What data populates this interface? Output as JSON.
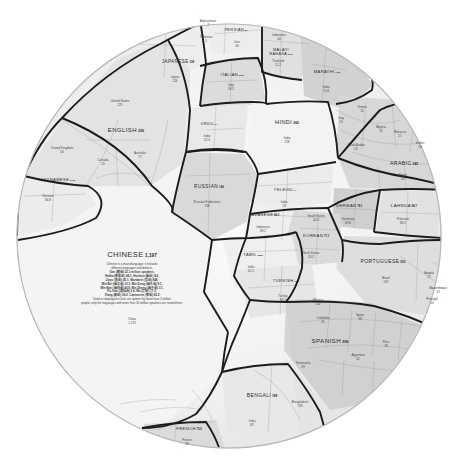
{
  "meta": {
    "subtitle": "Native speakers, in millions",
    "shape": "circular voronoi treemap",
    "unit": "millions of native speakers"
  },
  "chart_data": {
    "type": "treemap",
    "ylabel": "",
    "xlabel": "",
    "value_unit": "millions of native speakers",
    "layout": "circle packed voronoi; each language cell subdivided by country",
    "categories": [
      "CHINESE",
      "SPANISH",
      "ENGLISH",
      "HINDI",
      "ARABIC",
      "PORTUGUESE",
      "BENGALI",
      "RUSSIAN",
      "JAPANESE",
      "LAHNDA",
      "JAVANESE",
      "GERMAN",
      "KOREAN",
      "FRENCH",
      "TELEGU",
      "MARATHI",
      "TURKISH",
      "TAMIL",
      "VIETNAMESE",
      "URDU",
      "ITALIAN",
      "MALAY/BAHASA",
      "PERSIAN"
    ],
    "values": [
      1197,
      399,
      335,
      260,
      242,
      203,
      189,
      166,
      128,
      88.7,
      84.3,
      78.1,
      77.2,
      75.9,
      74,
      71.8,
      70.9,
      68.8,
      67.8,
      64,
      63.8,
      60.5,
      57
    ],
    "series": [
      {
        "name": "native speakers (millions)",
        "values": [
          1197,
          399,
          335,
          260,
          242,
          203,
          189,
          166,
          128,
          88.7,
          84.3,
          78.1,
          77.2,
          75.9,
          74,
          71.8,
          70.9,
          68.8,
          67.8,
          64,
          63.8,
          60.5,
          57
        ]
      }
    ]
  },
  "languages": [
    {
      "name": "CHINESE",
      "value": "1,197",
      "x": 132,
      "y": 255,
      "size": 7.6,
      "countries": [
        {
          "name": "China",
          "value": "1,191",
          "x": 132,
          "y": 322
        }
      ]
    },
    {
      "name": "SPANISH",
      "value": "399",
      "x": 330,
      "y": 341,
      "size": 6.2,
      "countries": [
        {
          "name": "Mexico",
          "value": "102",
          "x": 318,
          "y": 303
        },
        {
          "name": "Colombia",
          "value": "45",
          "x": 323,
          "y": 321
        },
        {
          "name": "Spain",
          "value": "38",
          "x": 360,
          "y": 318
        },
        {
          "name": "Argentina",
          "value": "41",
          "x": 358,
          "y": 358
        },
        {
          "name": "Peru",
          "value": "26",
          "x": 386,
          "y": 345
        },
        {
          "name": "Venezuela",
          "value": "29",
          "x": 303,
          "y": 366
        }
      ]
    },
    {
      "name": "ENGLISH",
      "value": "335",
      "x": 126,
      "y": 130,
      "size": 6.0,
      "countries": [
        {
          "name": "United States",
          "value": "225",
          "x": 120,
          "y": 104
        },
        {
          "name": "United Kingdom",
          "value": "56",
          "x": 62,
          "y": 151
        },
        {
          "name": "Canada",
          "value": "20",
          "x": 103,
          "y": 163
        },
        {
          "name": "Australia",
          "value": "17",
          "x": 140,
          "y": 156
        }
      ]
    },
    {
      "name": "HINDI",
      "value": "260",
      "x": 287,
      "y": 123,
      "size": 5.6,
      "countries": [
        {
          "name": "India",
          "value": "258",
          "x": 287,
          "y": 141
        }
      ]
    },
    {
      "name": "ARABIC",
      "value": "242",
      "x": 404,
      "y": 164,
      "size": 5.2,
      "countries": [
        {
          "name": "Egypt",
          "value": "65",
          "x": 403,
          "y": 178
        },
        {
          "name": "Algeria",
          "value": "32",
          "x": 381,
          "y": 130
        },
        {
          "name": "Saudi Arabia",
          "value": "24",
          "x": 356,
          "y": 148
        },
        {
          "name": "Morocco",
          "value": "21",
          "x": 400,
          "y": 135
        },
        {
          "name": "Sudan",
          "value": "18",
          "x": 420,
          "y": 146
        },
        {
          "name": "Iraq",
          "value": "24",
          "x": 341,
          "y": 121
        },
        {
          "name": "Yemen",
          "value": "15",
          "x": 362,
          "y": 110
        }
      ]
    },
    {
      "name": "PORTUGUESE",
      "value": "203",
      "x": 383,
      "y": 262,
      "size": 5.0,
      "countries": [
        {
          "name": "Brazil",
          "value": "207",
          "x": 386,
          "y": 281
        },
        {
          "name": "Portugal",
          "value": "10",
          "x": 432,
          "y": 302
        },
        {
          "name": "Angola",
          "value": "12",
          "x": 429,
          "y": 276
        },
        {
          "name": "Mozambique",
          "value": "13",
          "x": 438,
          "y": 291
        }
      ]
    },
    {
      "name": "BENGALI",
      "value": "189",
      "x": 262,
      "y": 396,
      "size": 5.0,
      "countries": [
        {
          "name": "Bangladesh",
          "value": "159",
          "x": 300,
          "y": 405
        },
        {
          "name": "India",
          "value": "82",
          "x": 252,
          "y": 424
        }
      ]
    },
    {
      "name": "RUSSIAN",
      "value": "166",
      "x": 209,
      "y": 187,
      "size": 4.8,
      "countries": [
        {
          "name": "Russian Federation",
          "value": "138",
          "x": 207,
          "y": 205
        }
      ]
    },
    {
      "name": "JAPANESE",
      "value": "128",
      "x": 178,
      "y": 62,
      "size": 4.6,
      "countries": [
        {
          "name": "Japan",
          "value": "126",
          "x": 175,
          "y": 80
        }
      ]
    },
    {
      "name": "LAHNDA",
      "value": "88.7",
      "x": 404,
      "y": 206,
      "size": 4.4,
      "countries": [
        {
          "name": "Pakistan",
          "value": "86.2",
          "x": 403,
          "y": 222
        }
      ]
    },
    {
      "name": "JAVANESE",
      "value": "84.3",
      "x": 264,
      "y": 215,
      "size": 4.2,
      "countries": [
        {
          "name": "Indonesia",
          "value": "83.2",
          "x": 263,
          "y": 230
        }
      ]
    },
    {
      "name": "GERMAN",
      "value": "78.1",
      "x": 349,
      "y": 206,
      "size": 4.2,
      "countries": [
        {
          "name": "Germany",
          "value": "69.8",
          "x": 348,
          "y": 222
        }
      ]
    },
    {
      "name": "KOREAN",
      "value": "77.2",
      "x": 316,
      "y": 236,
      "size": 4.2,
      "countries": [
        {
          "name": "South Korea",
          "value": "40.3",
          "x": 316,
          "y": 219
        },
        {
          "name": "North Korea",
          "value": "24.2",
          "x": 311,
          "y": 256
        }
      ]
    },
    {
      "name": "FRENCH",
      "value": "75.9",
      "x": 189,
      "y": 429,
      "size": 4.2,
      "countries": [
        {
          "name": "France",
          "value": "59",
          "x": 187,
          "y": 443
        }
      ]
    },
    {
      "name": "TELEGU",
      "value": "74",
      "x": 285,
      "y": 190,
      "size": 4.1,
      "countries": [
        {
          "name": "India",
          "value": "74",
          "x": 284,
          "y": 205
        }
      ]
    },
    {
      "name": "MARATHI",
      "value": "71.8",
      "x": 327,
      "y": 72,
      "size": 4.1,
      "countries": [
        {
          "name": "India",
          "value": "71.8",
          "x": 326,
          "y": 90
        }
      ]
    },
    {
      "name": "TURKISH",
      "value": "70.9",
      "x": 286,
      "y": 281,
      "size": 4.1,
      "countries": [
        {
          "name": "Turkey",
          "value": "66.3",
          "x": 283,
          "y": 299
        }
      ]
    },
    {
      "name": "TAMIL",
      "value": "68.8",
      "x": 253,
      "y": 255,
      "size": 4.1,
      "countries": [
        {
          "name": "India",
          "value": "61.5",
          "x": 251,
          "y": 270
        }
      ]
    },
    {
      "name": "VIETNAMESE",
      "value": "67.8",
      "x": 57,
      "y": 180,
      "size": 4.1,
      "countries": [
        {
          "name": "Vietnam",
          "value": "66.8",
          "x": 48,
          "y": 199
        }
      ]
    },
    {
      "name": "URDU",
      "value": "64",
      "x": 209,
      "y": 124,
      "size": 4.0,
      "countries": [
        {
          "name": "India",
          "value": "52.3",
          "x": 207,
          "y": 139
        }
      ]
    },
    {
      "name": "ITALIAN",
      "value": "63.8",
      "x": 232,
      "y": 75,
      "size": 4.0,
      "countries": [
        {
          "name": "Italy",
          "value": "58.5",
          "x": 231,
          "y": 88
        }
      ]
    },
    {
      "name": "MALAY/BAHASA",
      "value": "60.5",
      "x": 281,
      "y": 52,
      "size": 3.8,
      "countries": [
        {
          "name": "Indonesia",
          "value": "44",
          "x": 279,
          "y": 38
        },
        {
          "name": "Thailand",
          "value": "12.2",
          "x": 278,
          "y": 64
        }
      ]
    },
    {
      "name": "PERSIAN",
      "value": "57",
      "x": 236,
      "y": 30,
      "size": 3.9,
      "countries": [
        {
          "name": "Iran",
          "value": "44",
          "x": 237,
          "y": 45
        },
        {
          "name": "Afghanistan",
          "value": "7",
          "x": 208,
          "y": 24
        },
        {
          "name": "Tajikistan",
          "value": "5",
          "x": 206,
          "y": 40
        }
      ]
    }
  ],
  "chinese_note": {
    "heading": "Chinese is a macrolanguage: it includes",
    "line2": "different languages and dialects.",
    "entries": [
      "Gan (赣语) 22.1 million speakers,",
      "Hakka (客家话) 44.1, Huizhou (徽语) 4.6,",
      "Jinyu (晋语) 45.1, Mandarin (官话) 848,",
      "Min Bei (闽北语) 10.3, Min Dong (闽东语) 9.1,",
      "Min Nan (闽南语) 46.9, Min Zhong (闽中语) 3.1,",
      "Pu-Xian (莆仙话) 2.6, Wu (吴语) 77.2,",
      "Xiang (湘语) 36.0, Cantonese (粤语) 62.2"
    ],
    "footer_1": "Dialects displayed in italic are spoken by fewer than 5 million",
    "footer_2": "people; only the languages with more than 50 million speakers are named here."
  },
  "colors": {
    "stroke_major": "#1a1a1a",
    "stroke_minor": "#8a8a8a",
    "fill_light": "#f1f1f1",
    "fill_mid": "#e0e0e0",
    "fill_dark": "#cfcfcf",
    "fill_darker": "#bdbdbd",
    "text": "#2a2a2a"
  }
}
